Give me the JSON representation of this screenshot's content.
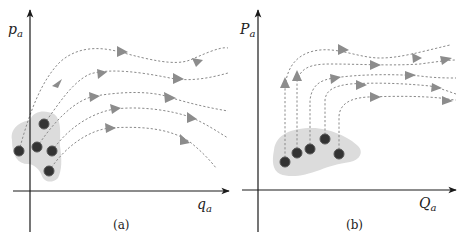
{
  "figure": {
    "panels": [
      {
        "id": "a",
        "caption": "(a)",
        "y_axis_label": {
          "main": "p",
          "sub": "a"
        },
        "x_axis_label": {
          "main": "q",
          "sub": "a"
        },
        "description": "Cluster of 5 points in a shaded region straddling the p-axis; dashed flow curves rise from the cluster and fan out to the right, some curving back down.",
        "points": [
          {
            "x": 19,
            "y": 151
          },
          {
            "x": 44,
            "y": 124
          },
          {
            "x": 37,
            "y": 147
          },
          {
            "x": 52,
            "y": 151
          },
          {
            "x": 49,
            "y": 171
          }
        ],
        "flow_line_count": 5
      },
      {
        "id": "b",
        "caption": "(b)",
        "y_axis_label": {
          "main": "P",
          "sub": "a"
        },
        "x_axis_label": {
          "main": "Q",
          "sub": "a"
        },
        "description": "Cluster of 5 points in a shaded region right of the P-axis; dashed flow curves rise vertically from each point then bend right, running roughly parallel.",
        "points": [
          {
            "x": 285,
            "y": 162
          },
          {
            "x": 297,
            "y": 153
          },
          {
            "x": 310,
            "y": 149
          },
          {
            "x": 325,
            "y": 139
          },
          {
            "x": 339,
            "y": 154
          }
        ],
        "flow_line_count": 5
      }
    ],
    "colors": {
      "axis": "#1a1a1a",
      "region_fill": "#dcdcdc",
      "point": "#333333",
      "point_ring": "#555555",
      "flow_line": "#8a8a8a",
      "arrowhead": "#8c8c8c"
    }
  }
}
